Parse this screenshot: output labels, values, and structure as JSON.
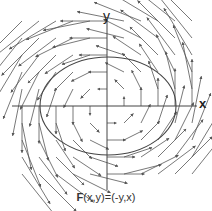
{
  "diagram": {
    "title": "F(x,y)=(-y,x)",
    "caption_bold": "F",
    "caption_rest": "(x,y)=(-y,x)",
    "x_axis_label": "x",
    "y_axis_label": "y",
    "field": "F(x,y) = (-y, x)",
    "type": "vector field with ellipse",
    "colors": {
      "arrows": "#555555",
      "axes": "#444444",
      "ellipse": "#444444",
      "background": "#ffffff"
    },
    "origin_px": [
      107,
      106
    ],
    "grid_step_px": 17,
    "ellipse": {
      "cx": 108,
      "cy": 106,
      "rx": 68,
      "ry": 49
    }
  }
}
